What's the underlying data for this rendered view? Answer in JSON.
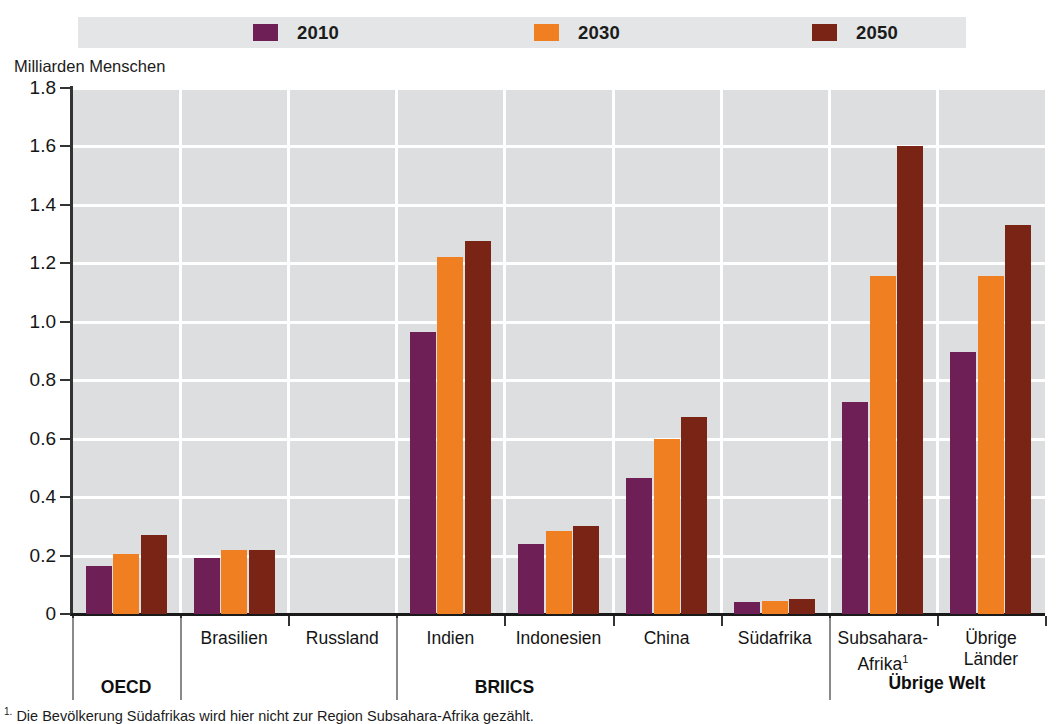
{
  "axis_title": "Milliarden Menschen",
  "colors": {
    "2010": "#6E1F55",
    "2030": "#F07F22",
    "2050": "#7A2415",
    "plot_background": "#DCDEE0",
    "legend_band": "#E3E5E6",
    "gridline": "#FFFFFF",
    "axis": "#333333"
  },
  "legend": {
    "items": [
      {
        "label": "2010",
        "color": "#6E1F55"
      },
      {
        "label": "2030",
        "color": "#F07F22"
      },
      {
        "label": "2050",
        "color": "#7A2415"
      }
    ]
  },
  "y_axis": {
    "label": "Milliarden Menschen",
    "ticks": [
      "1.8",
      "1.6",
      "1.4",
      "1.2",
      "1.0",
      "0.8",
      "0.6",
      "0.4",
      "0.2",
      "0"
    ],
    "min": 0,
    "max": 1.8
  },
  "groups": [
    {
      "label": "OECD",
      "categories": [
        "OECD"
      ]
    },
    {
      "label": "BRIICS",
      "categories": [
        "Brasilien",
        "Russland",
        "Indien",
        "Indonesien",
        "China",
        "Südafrika"
      ]
    },
    {
      "label": "Übrige Welt",
      "categories": [
        "Subsahara-Afrika¹",
        "Übrige Länder"
      ]
    }
  ],
  "footnote": "1. Die Bevölkerung Südafrikas wird hier nicht zur Region Subsahara-Afrika gezählt.",
  "chart_data": {
    "type": "bar",
    "title": "",
    "xlabel": "",
    "ylabel": "Milliarden Menschen",
    "ylim": [
      0,
      1.8
    ],
    "grid": true,
    "legend_position": "top",
    "categories": [
      "OECD",
      "Brasilien",
      "Russland",
      "Indien",
      "Indonesien",
      "China",
      "Südafrika",
      "Subsahara-Afrika¹",
      "Übrige Länder"
    ],
    "category_display": [
      [
        "OECD"
      ],
      [
        "Brasilien"
      ],
      [
        "Russland"
      ],
      [
        "Indien"
      ],
      [
        "Indonesien"
      ],
      [
        "China"
      ],
      [
        "Südafrika"
      ],
      [
        "Subsahara-",
        "Afrika¹"
      ],
      [
        "Übrige",
        "Länder"
      ]
    ],
    "group_spans": [
      {
        "label": "OECD",
        "start": 0,
        "end": 0
      },
      {
        "label": "BRIICS",
        "start": 1,
        "end": 6
      },
      {
        "label": "Übrige Welt",
        "start": 7,
        "end": 8
      }
    ],
    "series": [
      {
        "name": "2010",
        "color": "#6E1F55",
        "values": [
          0.165,
          0.19,
          0.0,
          0.965,
          0.24,
          0.465,
          0.04,
          0.725,
          0.895
        ]
      },
      {
        "name": "2030",
        "color": "#F07F22",
        "values": [
          0.205,
          0.22,
          0.0,
          1.22,
          0.285,
          0.6,
          0.045,
          1.155,
          1.155
        ]
      },
      {
        "name": "2050",
        "color": "#7A2415",
        "values": [
          0.27,
          0.22,
          0.0,
          1.275,
          0.3,
          0.675,
          0.05,
          1.6,
          1.33
        ]
      }
    ]
  }
}
